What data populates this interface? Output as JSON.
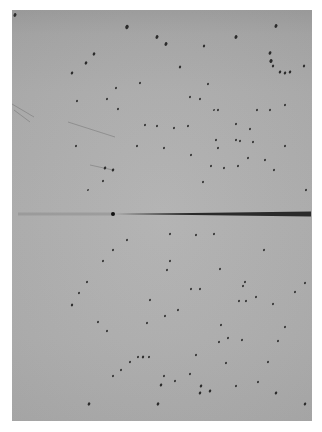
{
  "image": {
    "description": "X-ray diffraction oscillation photograph",
    "film": {
      "x": 12,
      "y": 10,
      "w": 300,
      "h": 411,
      "color": "#adadad"
    },
    "beam_stop": {
      "x1": 113,
      "x2": 311,
      "y": 214,
      "color": "#2a2a2a"
    },
    "faint_streak": {
      "x1": 18,
      "x2": 113,
      "y": 214
    },
    "scratches": [
      {
        "x1": 12,
        "y1": 104,
        "x2": 34,
        "y2": 117
      },
      {
        "x1": 14,
        "y1": 110,
        "x2": 30,
        "y2": 122
      },
      {
        "x1": 68,
        "y1": 122,
        "x2": 115,
        "y2": 137
      },
      {
        "x1": 90,
        "y1": 165,
        "x2": 113,
        "y2": 170
      }
    ],
    "spots": [
      [
        15,
        15,
        1.6
      ],
      [
        127,
        27,
        1.8
      ],
      [
        157,
        37,
        1.6
      ],
      [
        94,
        54,
        1.4
      ],
      [
        86,
        63,
        1.4
      ],
      [
        72,
        73,
        1.3
      ],
      [
        166,
        44,
        1.6
      ],
      [
        236,
        37,
        1.6
      ],
      [
        276,
        26,
        1.6
      ],
      [
        204,
        46,
        1.2
      ],
      [
        270,
        53,
        1.5
      ],
      [
        271,
        61,
        1.7
      ],
      [
        273,
        66,
        1.2
      ],
      [
        280,
        72,
        1.3
      ],
      [
        285,
        73,
        1.3
      ],
      [
        290,
        72,
        1.3
      ],
      [
        304,
        66,
        1.2
      ],
      [
        180,
        67,
        1.2
      ],
      [
        208,
        84,
        1.0
      ],
      [
        200,
        99,
        1.0
      ],
      [
        214,
        110,
        0.9
      ],
      [
        190,
        97,
        1.0
      ],
      [
        140,
        83,
        1.0
      ],
      [
        116,
        88,
        1.0
      ],
      [
        107,
        99,
        1.0
      ],
      [
        77,
        101,
        1.0
      ],
      [
        118,
        109,
        1.0
      ],
      [
        145,
        125,
        1.0
      ],
      [
        137,
        146,
        1.0
      ],
      [
        76,
        146,
        1.0
      ],
      [
        105,
        168,
        1.3
      ],
      [
        113,
        170,
        1.3
      ],
      [
        103,
        181,
        1.0
      ],
      [
        88,
        190,
        0.9
      ],
      [
        218,
        110,
        1.0
      ],
      [
        257,
        110,
        1.0
      ],
      [
        270,
        110,
        1.0
      ],
      [
        285,
        105,
        1.0
      ],
      [
        236,
        124,
        1.0
      ],
      [
        250,
        129,
        1.0
      ],
      [
        248,
        158,
        1.0
      ],
      [
        253,
        142,
        1.0
      ],
      [
        240,
        141,
        1.0
      ],
      [
        236,
        140,
        1.0
      ],
      [
        216,
        140,
        1.0
      ],
      [
        285,
        146,
        1.0
      ],
      [
        265,
        160,
        1.0
      ],
      [
        211,
        166,
        1.0
      ],
      [
        224,
        168,
        1.0
      ],
      [
        238,
        166,
        1.0
      ],
      [
        218,
        148,
        1.0
      ],
      [
        188,
        126,
        1.0
      ],
      [
        174,
        128,
        1.0
      ],
      [
        164,
        148,
        1.0
      ],
      [
        157,
        126,
        1.0
      ],
      [
        191,
        155,
        1.0
      ],
      [
        274,
        170,
        1.0
      ],
      [
        203,
        182,
        1.0
      ],
      [
        306,
        190,
        1.0
      ],
      [
        127,
        240,
        1.0
      ],
      [
        113,
        250,
        1.0
      ],
      [
        103,
        261,
        1.0
      ],
      [
        87,
        282,
        1.0
      ],
      [
        79,
        293,
        1.0
      ],
      [
        72,
        305,
        1.2
      ],
      [
        98,
        322,
        1.0
      ],
      [
        107,
        331,
        1.0
      ],
      [
        150,
        300,
        1.0
      ],
      [
        147,
        323,
        1.0
      ],
      [
        138,
        357,
        1.0
      ],
      [
        143,
        357,
        1.2
      ],
      [
        149,
        357,
        1.0
      ],
      [
        130,
        362,
        1.0
      ],
      [
        121,
        370,
        1.0
      ],
      [
        113,
        376,
        1.0
      ],
      [
        89,
        404,
        1.4
      ],
      [
        158,
        404,
        1.4
      ],
      [
        170,
        234,
        1.0
      ],
      [
        196,
        235,
        1.0
      ],
      [
        214,
        234,
        1.0
      ],
      [
        167,
        270,
        1.0
      ],
      [
        191,
        289,
        1.0
      ],
      [
        200,
        289,
        1.0
      ],
      [
        220,
        269,
        1.0
      ],
      [
        245,
        282,
        1.0
      ],
      [
        239,
        301,
        1.0
      ],
      [
        246,
        301,
        1.0
      ],
      [
        221,
        325,
        1.0
      ],
      [
        219,
        342,
        1.0
      ],
      [
        226,
        363,
        1.0
      ],
      [
        236,
        386,
        1.0
      ],
      [
        210,
        391,
        1.3
      ],
      [
        200,
        393,
        1.3
      ],
      [
        201,
        386,
        1.3
      ],
      [
        161,
        385,
        1.3
      ],
      [
        164,
        376,
        1.0
      ],
      [
        175,
        381,
        1.0
      ],
      [
        190,
        374,
        1.0
      ],
      [
        228,
        338,
        1.0
      ],
      [
        242,
        340,
        1.0
      ],
      [
        258,
        382,
        1.0
      ],
      [
        268,
        362,
        1.0
      ],
      [
        276,
        393,
        1.3
      ],
      [
        278,
        341,
        1.0
      ],
      [
        285,
        327,
        1.0
      ],
      [
        295,
        292,
        1.0
      ],
      [
        305,
        283,
        1.0
      ],
      [
        305,
        404,
        1.3
      ],
      [
        264,
        250,
        1.0
      ],
      [
        170,
        261,
        1.0
      ],
      [
        178,
        310,
        1.0
      ],
      [
        165,
        316,
        1.0
      ],
      [
        243,
        286,
        1.0
      ],
      [
        196,
        355,
        1.0
      ],
      [
        273,
        304,
        1.0
      ],
      [
        256,
        297,
        1.0
      ]
    ]
  }
}
